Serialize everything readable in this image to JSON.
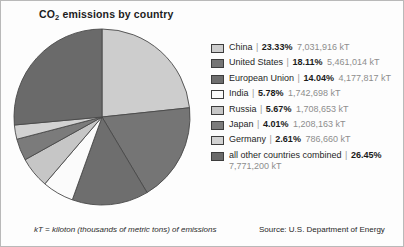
{
  "title": {
    "prefix": "CO",
    "subscript": "2",
    "suffix": " emissions by country",
    "full": "CO2 emissions by country"
  },
  "footnotes": {
    "left": "kT = kiloton (thousands of metric tons) of emissions",
    "right": "Source: U.S. Department of Energy"
  },
  "legend": {
    "separator": "|",
    "rows": [
      {
        "name": "China",
        "percent": "23.33%",
        "value": "7,031,916 kT",
        "color": "#cdcdcd"
      },
      {
        "name": "United States",
        "percent": "18.11%",
        "value": "5,461,014 kT",
        "color": "#757575"
      },
      {
        "name": "European Union",
        "percent": "14.04%",
        "value": "4,177,817 kT",
        "color": "#6e6e6e"
      },
      {
        "name": "India",
        "percent": "5.78%",
        "value": "1,742,698 kT",
        "color": "#fbfbfb"
      },
      {
        "name": "Russia",
        "percent": "5.67%",
        "value": "1,708,653 kT",
        "color": "#c6c6c6"
      },
      {
        "name": "Japan",
        "percent": "4.01%",
        "value": "1,208,163 kT",
        "color": "#7b7b7b"
      },
      {
        "name": "Germany",
        "percent": "2.61%",
        "value": "786,660 kT",
        "color": "#d2d2d2"
      },
      {
        "name": "all other countries combined",
        "percent": "26.45%",
        "value": "7,771,200 kT",
        "color": "#6a6a6a"
      }
    ]
  },
  "chart_data": {
    "type": "pie",
    "title": "CO2 emissions by country",
    "unit": "kT",
    "unit_definition": "kiloton (thousands of metric tons) of emissions",
    "source": "U.S. Department of Energy",
    "start_angle_deg": 0,
    "direction": "clockwise",
    "legend_position": "right",
    "categories": [
      "China",
      "United States",
      "European Union",
      "India",
      "Russia",
      "Japan",
      "Germany",
      "all other countries combined"
    ],
    "values": [
      23.33,
      18.11,
      14.04,
      5.78,
      5.67,
      4.01,
      2.61,
      26.45
    ],
    "absolute_values": [
      7031916,
      5461014,
      4177817,
      1742698,
      1708653,
      1208163,
      786660,
      7771200
    ],
    "value_labels": [
      "7,031,916 kT",
      "5,461,014 kT",
      "4,177,817 kT",
      "1,742,698 kT",
      "1,708,653 kT",
      "1,208,163 kT",
      "786,660 kT",
      "7,771,200 kT"
    ],
    "percent_labels": [
      "23.33%",
      "18.11%",
      "14.04%",
      "5.78%",
      "5.67%",
      "4.01%",
      "2.61%",
      "26.45%"
    ],
    "colors": [
      "#cdcdcd",
      "#757575",
      "#6e6e6e",
      "#fbfbfb",
      "#c6c6c6",
      "#7b7b7b",
      "#d2d2d2",
      "#6a6a6a"
    ],
    "slice_border_color": "#4a4a4a"
  }
}
